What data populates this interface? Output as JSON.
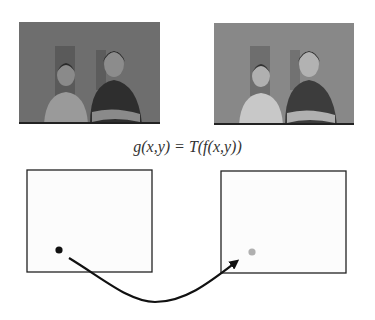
{
  "figure": {
    "equation": "g(x,y) = T(f(x,y))",
    "input_image": {
      "label": "original image f",
      "tone": "darker"
    },
    "output_image": {
      "label": "transformed image g",
      "tone": "brighter"
    },
    "input_box": {
      "label": "input image plane",
      "pixel_color": "#111111"
    },
    "output_box": {
      "label": "output image plane",
      "pixel_color": "#b0b0b0"
    },
    "arrow": {
      "label": "transformation T",
      "color": "#111111"
    }
  }
}
